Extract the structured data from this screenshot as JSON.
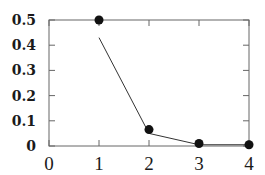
{
  "chart_data": {
    "type": "line",
    "title": "",
    "xlabel": "",
    "ylabel": "",
    "xlim": [
      0,
      4
    ],
    "ylim": [
      0,
      0.5
    ],
    "x_ticks": [
      "0",
      "1",
      "2",
      "3",
      "4"
    ],
    "y_ticks": [
      "0",
      "0.1",
      "0.2",
      "0.3",
      "0.4",
      "0.5"
    ],
    "grid": false,
    "legend": null,
    "series": [
      {
        "name": "points",
        "style": "markers",
        "x": [
          1,
          2,
          3,
          4
        ],
        "y": [
          0.5,
          0.065,
          0.01,
          0.005
        ]
      },
      {
        "name": "line",
        "style": "line",
        "x": [
          1,
          2,
          3,
          4
        ],
        "y": [
          0.43,
          0.05,
          0.005,
          0.005
        ]
      }
    ]
  },
  "colors": {
    "axis": "#555555",
    "line": "#333333",
    "marker": "#111111"
  }
}
